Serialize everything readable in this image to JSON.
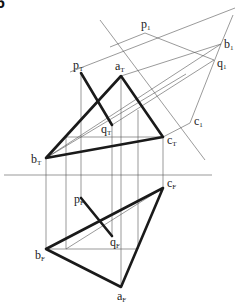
{
  "figure": {
    "corner_text": "6",
    "labels": {
      "p1": {
        "base": "p",
        "sub": "1",
        "x": 141,
        "y": 28
      },
      "b1": {
        "base": "b",
        "sub": "1",
        "x": 224,
        "y": 48
      },
      "q1": {
        "base": "q",
        "sub": "1",
        "x": 218,
        "y": 67
      },
      "c1": {
        "base": "c",
        "sub": "1",
        "x": 194,
        "y": 125
      },
      "pT": {
        "base": "p",
        "sub": "T",
        "x": 73,
        "y": 69
      },
      "aT": {
        "base": "a",
        "sub": "T",
        "x": 115,
        "y": 70
      },
      "qT": {
        "base": "q",
        "sub": "T",
        "x": 102,
        "y": 138
      },
      "cT": {
        "base": "c",
        "sub": "T",
        "x": 167,
        "y": 146
      },
      "bT": {
        "base": "b",
        "sub": "T",
        "x": 31,
        "y": 165
      },
      "cF": {
        "base": "c",
        "sub": "F",
        "x": 167,
        "y": 188
      },
      "pF": {
        "base": "p",
        "sub": "F",
        "x": 74,
        "y": 206
      },
      "qF": {
        "base": "q",
        "sub": "F",
        "x": 110,
        "y": 247
      },
      "bF": {
        "base": "b",
        "sub": "F",
        "x": 36,
        "y": 260
      },
      "aF": {
        "base": "a",
        "sub": "F",
        "x": 117,
        "y": 301
      }
    },
    "points": {
      "aT": [
        121,
        76
      ],
      "bT": [
        46,
        158
      ],
      "cT": [
        163,
        137
      ],
      "pT": [
        81,
        73
      ],
      "qT": [
        112,
        125
      ],
      "aF": [
        121,
        287
      ],
      "bF": [
        46,
        249
      ],
      "cF": [
        163,
        188
      ],
      "pF": [
        81,
        198
      ],
      "qF": [
        112,
        236
      ],
      "p1": [
        145,
        33
      ],
      "b1": [
        221,
        44
      ],
      "q1": [
        214,
        60
      ],
      "c1": [
        190,
        123
      ]
    },
    "colors": {
      "thick": "#1a1a1a",
      "thin": "#555555",
      "background": "#ffffff"
    }
  }
}
